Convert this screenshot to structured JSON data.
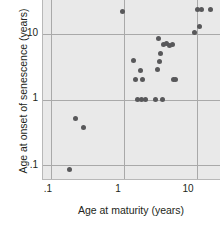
{
  "chart_data": {
    "type": "scatter",
    "title": "",
    "xlabel": "Age at maturity (years)",
    "ylabel": "Age at onset of senescence (years)",
    "xscale": "log",
    "yscale": "log",
    "xlim": [
      0.078,
      21.0
    ],
    "ylim": [
      0.062,
      33.0
    ],
    "xticks": [
      ".1",
      "1",
      "10"
    ],
    "xtick_values": [
      0.1,
      1,
      10
    ],
    "yticks": [
      "10",
      "1",
      ".1"
    ],
    "ytick_values": [
      10,
      1,
      0.1
    ],
    "grid": true,
    "legend": null,
    "marker_color": "#58585a",
    "plot_background": "#e9e9e9",
    "grid_color": "#a9a9a9",
    "axis_color": "#b8b8b8",
    "text_color": "#231f20",
    "series": [
      {
        "name": "species",
        "x": [
          0.18,
          0.22,
          0.28,
          0.95,
          1.35,
          1.45,
          1.55,
          1.7,
          1.75,
          1.8,
          2.0,
          2.7,
          2.9,
          3.0,
          3.1,
          3.2,
          3.4,
          3.5,
          3.9,
          4.3,
          4.6,
          4.8,
          5.2,
          9.5,
          10.2,
          11.0,
          11.5,
          15.5
        ],
        "y": [
          0.088,
          0.52,
          0.38,
          22.0,
          3.9,
          2.0,
          1.0,
          2.8,
          1.0,
          2.0,
          1.0,
          1.0,
          2.9,
          8.5,
          3.8,
          5.0,
          1.0,
          7.0,
          7.2,
          6.8,
          7.0,
          2.0,
          2.0,
          10.5,
          24.0,
          13.0,
          24.0,
          24.0
        ]
      }
    ]
  }
}
